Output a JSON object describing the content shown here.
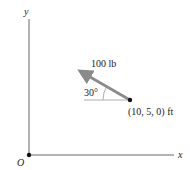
{
  "diagram": {
    "axes": {
      "x_label": "x",
      "y_label": "y",
      "origin_label": "O"
    },
    "force": {
      "magnitude_label": "100 lb",
      "angle_label": "30°",
      "point_label": "(10, 5, 0) ft"
    },
    "colors": {
      "axis": "#555555",
      "arrow": "#8a8a8a",
      "point": "#111111"
    }
  }
}
